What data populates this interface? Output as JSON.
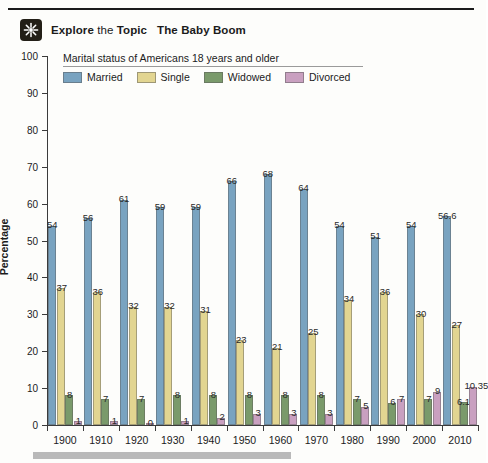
{
  "header": {
    "icon": "starburst-icon",
    "label_bold": "Explore",
    "label_normal": " the ",
    "label_bold2": "Topic",
    "title": "The Baby Boom"
  },
  "legend": {
    "title": "Marital status of Americans 18 years and older",
    "items": [
      {
        "label": "Married",
        "color": "#79a3c0"
      },
      {
        "label": "Single",
        "color": "#e2d591"
      },
      {
        "label": "Widowed",
        "color": "#7a9a6b"
      },
      {
        "label": "Divorced",
        "color": "#c9a0c0"
      }
    ]
  },
  "axes": {
    "y_title": "Percentage",
    "y_ticks": [
      "0",
      "10",
      "20",
      "30",
      "40",
      "50",
      "60",
      "70",
      "80",
      "90",
      "100"
    ],
    "x_ticks": [
      "1900",
      "1910",
      "1920",
      "1930",
      "1940",
      "1950",
      "1960",
      "1970",
      "1980",
      "1990",
      "2000",
      "2010"
    ]
  },
  "chart_data": {
    "type": "bar",
    "title": "The Baby Boom",
    "subtitle": "Marital status of Americans 18 years and older",
    "xlabel": "",
    "ylabel": "Percentage",
    "ylim": [
      0,
      100
    ],
    "ytick_step": 10,
    "grid": false,
    "legend_position": "top-left",
    "categories": [
      "1900",
      "1910",
      "1920",
      "1930",
      "1940",
      "1950",
      "1960",
      "1970",
      "1980",
      "1990",
      "2000",
      "2010"
    ],
    "series": [
      {
        "name": "Married",
        "color": "#79a3c0",
        "values": [
          54,
          56,
          61,
          59,
          59,
          66,
          68,
          64,
          54,
          51,
          54,
          56.6
        ],
        "labels": [
          "54",
          "56",
          "61",
          "59",
          "59",
          "66",
          "68",
          "64",
          "54",
          "51",
          "54",
          "56.6"
        ]
      },
      {
        "name": "Single",
        "color": "#e2d591",
        "values": [
          37,
          36,
          32,
          32,
          31,
          23,
          21,
          25,
          34,
          36,
          30,
          27
        ],
        "labels": [
          "37",
          "36",
          "32",
          "32",
          "31",
          "23",
          "21",
          "25",
          "34",
          "36",
          "30",
          "27"
        ]
      },
      {
        "name": "Widowed",
        "color": "#7a9a6b",
        "values": [
          8,
          7,
          7,
          8,
          8,
          8,
          8,
          8,
          7,
          6,
          7,
          6.15
        ],
        "labels": [
          "8",
          "7",
          "7",
          "8",
          "8",
          "8",
          "8",
          "8",
          "7",
          "6",
          "7",
          "6.15"
        ]
      },
      {
        "name": "Divorced",
        "color": "#c9a0c0",
        "values": [
          1,
          1,
          0,
          1,
          2,
          3,
          3,
          3,
          5,
          7,
          9,
          10.35
        ],
        "labels": [
          "1",
          "1",
          "0",
          "1",
          "2",
          "3",
          "3",
          "3",
          "5",
          "7",
          "9",
          "10.35"
        ]
      }
    ]
  }
}
